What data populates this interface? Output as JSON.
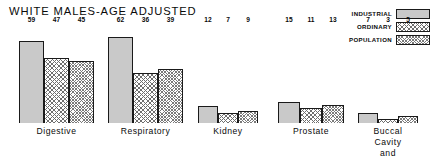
{
  "chart_data": {
    "type": "bar",
    "title": "WHITE MALES-AGE ADJUSTED",
    "xlabel": "",
    "ylabel": "",
    "ylim": [
      0,
      62
    ],
    "grid": false,
    "legend_position": "top-right",
    "categories": [
      "Digestive",
      "Respiratory",
      "Kidney",
      "Prostate",
      "Buccal Cavity\nand Pharynx"
    ],
    "series": [
      {
        "name": "INDUSTRIAL",
        "values": [
          59,
          62,
          12,
          15,
          7
        ]
      },
      {
        "name": "ORDINARY",
        "values": [
          47,
          36,
          7,
          11,
          3
        ]
      },
      {
        "name": "POPULATION",
        "values": [
          45,
          39,
          9,
          13,
          5
        ]
      }
    ]
  },
  "legend": {
    "items": [
      {
        "label": "INDUSTRIAL",
        "pattern": "solid-gray",
        "color": "#c9c9c9"
      },
      {
        "label": "ORDINARY",
        "pattern": "cross-hatch",
        "color": "#6e6e6e"
      },
      {
        "label": "POPULATION",
        "pattern": "fine-cross-hatch",
        "color": "#7a7a7a"
      }
    ]
  }
}
